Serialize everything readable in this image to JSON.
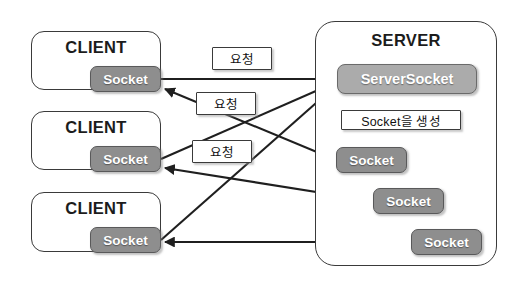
{
  "diagram": {
    "type": "network-architecture-diagram",
    "title_text": "Client-Server Socket Connection Diagram",
    "width": 520,
    "height": 288,
    "background_color": "#ffffff",
    "colors": {
      "socket_fill": "#8e8e8e",
      "serversocket_fill": "#ababab",
      "container_border": "#3a3a3a",
      "label_fill": "#ffffff",
      "edge_color": "#1f1f1f",
      "text_light": "#ffffff",
      "text_dark": "#111111"
    }
  },
  "clients": [
    {
      "title": "CLIENT",
      "socket_label": "Socket",
      "box": {
        "x": 31,
        "y": 31,
        "w": 130,
        "h": 59
      },
      "socket": {
        "x": 90,
        "y": 66,
        "w": 71,
        "h": 26
      }
    },
    {
      "title": "CLIENT",
      "socket_label": "Socket",
      "box": {
        "x": 31,
        "y": 111,
        "w": 130,
        "h": 59
      },
      "socket": {
        "x": 90,
        "y": 146,
        "w": 71,
        "h": 26
      }
    },
    {
      "title": "CLIENT",
      "socket_label": "Socket",
      "box": {
        "x": 31,
        "y": 192,
        "w": 130,
        "h": 60
      },
      "socket": {
        "x": 90,
        "y": 227,
        "w": 71,
        "h": 26
      }
    }
  ],
  "server": {
    "title": "SERVER",
    "box": {
      "x": 315,
      "y": 21,
      "w": 182,
      "h": 245
    },
    "serversocket": {
      "label": "ServerSocket",
      "x": 337,
      "y": 64,
      "w": 140,
      "h": 30
    },
    "create_label": {
      "label": "Socket을 생성",
      "x": 341,
      "y": 110,
      "w": 120,
      "h": 20
    },
    "sockets": [
      {
        "label": "Socket",
        "x": 336,
        "y": 147,
        "w": 71,
        "h": 26
      },
      {
        "label": "Socket",
        "x": 373,
        "y": 188,
        "w": 71,
        "h": 26
      },
      {
        "label": "Socket",
        "x": 411,
        "y": 229,
        "w": 71,
        "h": 26
      }
    ]
  },
  "request_labels": [
    {
      "label": "요청",
      "x": 212,
      "y": 47,
      "w": 60,
      "h": 23
    },
    {
      "label": "요청",
      "x": 196,
      "y": 92,
      "w": 60,
      "h": 23
    },
    {
      "label": "요청",
      "x": 192,
      "y": 140,
      "w": 60,
      "h": 23
    }
  ],
  "edges": {
    "requests_to_serversocket": [
      {
        "from": "client1.socket",
        "to": "serversocket",
        "x1": 161,
        "y1": 79,
        "x2": 335,
        "y2": 79
      },
      {
        "from": "client2.socket",
        "to": "serversocket",
        "x1": 161,
        "y1": 159,
        "x2": 335,
        "y2": 83
      },
      {
        "from": "client3.socket",
        "to": "serversocket",
        "x1": 161,
        "y1": 240,
        "x2": 335,
        "y2": 87
      }
    ],
    "serversocket_to_sockets": [
      {
        "from": "serversocket",
        "to": "server.socket1",
        "x1": 371,
        "y1": 94,
        "x2": 371,
        "y2": 145
      },
      {
        "from": "serversocket",
        "to": "server.socket2",
        "x1": 409,
        "y1": 94,
        "x2": 409,
        "y2": 186
      },
      {
        "from": "serversocket",
        "to": "server.socket3",
        "x1": 447,
        "y1": 94,
        "x2": 447,
        "y2": 227
      }
    ],
    "sockets_to_clients": [
      {
        "from": "server.socket1",
        "to": "client1.socket",
        "x1": 336,
        "y1": 160,
        "x2": 163,
        "y2": 88
      },
      {
        "from": "server.socket2",
        "to": "client2.socket",
        "x1": 373,
        "y1": 201,
        "x2": 163,
        "y2": 168
      },
      {
        "from": "server.socket3",
        "to": "client3.socket",
        "x1": 411,
        "y1": 242,
        "x2": 163,
        "y2": 242
      }
    ]
  }
}
